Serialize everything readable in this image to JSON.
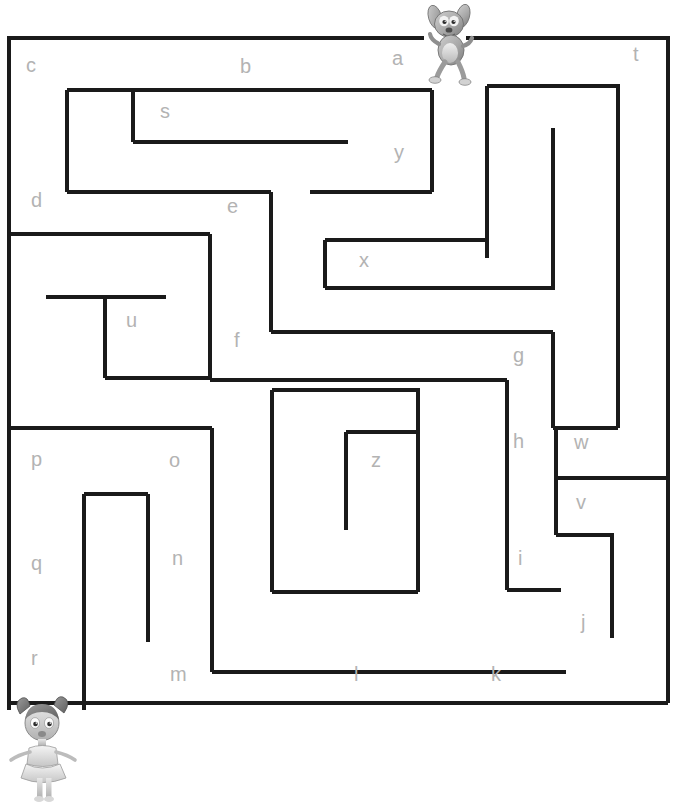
{
  "page": {
    "width": 678,
    "height": 808,
    "background": "#ffffff"
  },
  "maze": {
    "stroke_color": "#1a1a1a",
    "stroke_width": 4,
    "letter_color": "#b3b3b3",
    "letter_font_size": 20,
    "outer_border": {
      "x": 7,
      "y": 36,
      "width": 663,
      "height": 669
    },
    "entrance": {
      "name": "top-entrance",
      "x_start": 424,
      "x_end": 466,
      "y": 36
    },
    "exit": {
      "name": "bottom-left-exit",
      "x": 7,
      "y_start": 710,
      "y_end": 705
    },
    "letters": [
      {
        "id": "a",
        "label": "a",
        "x": 392,
        "y": 48
      },
      {
        "id": "b",
        "label": "b",
        "x": 240,
        "y": 56
      },
      {
        "id": "c",
        "label": "c",
        "x": 26,
        "y": 55
      },
      {
        "id": "d",
        "label": "d",
        "x": 31,
        "y": 190
      },
      {
        "id": "e",
        "label": "e",
        "x": 227,
        "y": 196
      },
      {
        "id": "f",
        "label": "f",
        "x": 234,
        "y": 330
      },
      {
        "id": "g",
        "label": "g",
        "x": 513,
        "y": 345
      },
      {
        "id": "h",
        "label": "h",
        "x": 513,
        "y": 431
      },
      {
        "id": "i",
        "label": "i",
        "x": 518,
        "y": 548
      },
      {
        "id": "j",
        "label": "j",
        "x": 581,
        "y": 612
      },
      {
        "id": "k",
        "label": "k",
        "x": 491,
        "y": 664
      },
      {
        "id": "l",
        "label": "l",
        "x": 354,
        "y": 664
      },
      {
        "id": "m",
        "label": "m",
        "x": 170,
        "y": 664
      },
      {
        "id": "n",
        "label": "n",
        "x": 172,
        "y": 548
      },
      {
        "id": "o",
        "label": "o",
        "x": 169,
        "y": 450
      },
      {
        "id": "p",
        "label": "p",
        "x": 31,
        "y": 449
      },
      {
        "id": "q",
        "label": "q",
        "x": 31,
        "y": 553
      },
      {
        "id": "r",
        "label": "r",
        "x": 31,
        "y": 648
      },
      {
        "id": "s",
        "label": "s",
        "x": 160,
        "y": 101
      },
      {
        "id": "t",
        "label": "t",
        "x": 633,
        "y": 44
      },
      {
        "id": "u",
        "label": "u",
        "x": 126,
        "y": 310
      },
      {
        "id": "v",
        "label": "v",
        "x": 576,
        "y": 492
      },
      {
        "id": "w",
        "label": "w",
        "x": 574,
        "y": 432
      },
      {
        "id": "x",
        "label": "x",
        "x": 359,
        "y": 250
      },
      {
        "id": "y",
        "label": "y",
        "x": 394,
        "y": 142
      },
      {
        "id": "z",
        "label": "z",
        "x": 371,
        "y": 450
      }
    ],
    "walls": [
      {
        "id": "border-top-left",
        "x1": 7,
        "y1": 38,
        "x2": 424,
        "y2": 38
      },
      {
        "id": "border-top-right",
        "x1": 466,
        "y1": 38,
        "x2": 670,
        "y2": 38
      },
      {
        "id": "border-right",
        "x1": 668,
        "y1": 38,
        "x2": 668,
        "y2": 703
      },
      {
        "id": "border-bottom",
        "x1": 7,
        "y1": 703,
        "x2": 668,
        "y2": 703
      },
      {
        "id": "border-left-upper",
        "x1": 9,
        "y1": 38,
        "x2": 9,
        "y2": 710
      },
      {
        "id": "w-s-top",
        "x1": 67,
        "y1": 90,
        "x2": 240,
        "y2": 90
      },
      {
        "id": "w-s-top2",
        "x1": 240,
        "y1": 90,
        "x2": 328,
        "y2": 90
      },
      {
        "id": "w-s-vert",
        "x1": 133,
        "y1": 90,
        "x2": 133,
        "y2": 142
      },
      {
        "id": "w-s-bottom",
        "x1": 133,
        "y1": 142,
        "x2": 348,
        "y2": 142
      },
      {
        "id": "w-c-vert",
        "x1": 67,
        "y1": 90,
        "x2": 67,
        "y2": 192
      },
      {
        "id": "w-d-bottom",
        "x1": 67,
        "y1": 192,
        "x2": 271,
        "y2": 192
      },
      {
        "id": "w-y-top",
        "x1": 310,
        "y1": 90,
        "x2": 432,
        "y2": 90
      },
      {
        "id": "w-y-right",
        "x1": 432,
        "y1": 90,
        "x2": 432,
        "y2": 192
      },
      {
        "id": "w-y-bottom",
        "x1": 310,
        "y1": 192,
        "x2": 432,
        "y2": 192
      },
      {
        "id": "w-right-inner-top",
        "x1": 487,
        "y1": 86,
        "x2": 620,
        "y2": 86
      },
      {
        "id": "w-right-inner-l",
        "x1": 487,
        "y1": 86,
        "x2": 487,
        "y2": 258
      },
      {
        "id": "w-right-inner-r",
        "x1": 618,
        "y1": 86,
        "x2": 618,
        "y2": 428
      },
      {
        "id": "w-e-vert",
        "x1": 271,
        "y1": 192,
        "x2": 271,
        "y2": 332
      },
      {
        "id": "w-u-top",
        "x1": 9,
        "y1": 234,
        "x2": 210,
        "y2": 234
      },
      {
        "id": "w-u-right",
        "x1": 210,
        "y1": 234,
        "x2": 210,
        "y2": 378
      },
      {
        "id": "w-u-bar",
        "x1": 46,
        "y1": 297,
        "x2": 166,
        "y2": 297
      },
      {
        "id": "w-u-stub",
        "x1": 105,
        "y1": 297,
        "x2": 105,
        "y2": 378
      },
      {
        "id": "w-u-bottom",
        "x1": 105,
        "y1": 378,
        "x2": 210,
        "y2": 378
      },
      {
        "id": "w-x-left",
        "x1": 325,
        "y1": 240,
        "x2": 325,
        "y2": 288
      },
      {
        "id": "w-x-top",
        "x1": 325,
        "y1": 240,
        "x2": 487,
        "y2": 240
      },
      {
        "id": "w-x-bottom",
        "x1": 325,
        "y1": 288,
        "x2": 555,
        "y2": 288
      },
      {
        "id": "w-x-right",
        "x1": 553,
        "y1": 128,
        "x2": 553,
        "y2": 288
      },
      {
        "id": "w-f-bottom",
        "x1": 271,
        "y1": 332,
        "x2": 553,
        "y2": 332
      },
      {
        "id": "w-g-vert",
        "x1": 553,
        "y1": 332,
        "x2": 553,
        "y2": 428
      },
      {
        "id": "w-g-horiz",
        "x1": 553,
        "y1": 428,
        "x2": 618,
        "y2": 428
      },
      {
        "id": "w-mid-horiz",
        "x1": 210,
        "y1": 380,
        "x2": 507,
        "y2": 380
      },
      {
        "id": "w-h-vert",
        "x1": 507,
        "y1": 380,
        "x2": 507,
        "y2": 590
      },
      {
        "id": "w-i-horiz",
        "x1": 507,
        "y1": 590,
        "x2": 561,
        "y2": 590
      },
      {
        "id": "w-wv-divider",
        "x1": 556,
        "y1": 478,
        "x2": 668,
        "y2": 478
      },
      {
        "id": "w-v-left",
        "x1": 556,
        "y1": 428,
        "x2": 556,
        "y2": 535
      },
      {
        "id": "w-v-bottom",
        "x1": 556,
        "y1": 535,
        "x2": 614,
        "y2": 535
      },
      {
        "id": "w-j-vert",
        "x1": 612,
        "y1": 535,
        "x2": 612,
        "y2": 638
      },
      {
        "id": "w-o-top",
        "x1": 9,
        "y1": 428,
        "x2": 212,
        "y2": 428
      },
      {
        "id": "w-o-right",
        "x1": 212,
        "y1": 428,
        "x2": 212,
        "y2": 672
      },
      {
        "id": "w-m-bottom",
        "x1": 212,
        "y1": 672,
        "x2": 566,
        "y2": 672
      },
      {
        "id": "w-n-left",
        "x1": 84,
        "y1": 494,
        "x2": 84,
        "y2": 710
      },
      {
        "id": "w-n-top",
        "x1": 84,
        "y1": 494,
        "x2": 148,
        "y2": 494
      },
      {
        "id": "w-n-right",
        "x1": 148,
        "y1": 494,
        "x2": 148,
        "y2": 642
      },
      {
        "id": "w-center-left",
        "x1": 272,
        "y1": 390,
        "x2": 272,
        "y2": 592
      },
      {
        "id": "w-center-top",
        "x1": 272,
        "y1": 390,
        "x2": 420,
        "y2": 390
      },
      {
        "id": "w-center-right",
        "x1": 418,
        "y1": 390,
        "x2": 418,
        "y2": 592
      },
      {
        "id": "w-center-bottom",
        "x1": 272,
        "y1": 592,
        "x2": 418,
        "y2": 592
      },
      {
        "id": "w-z-left",
        "x1": 346,
        "y1": 432,
        "x2": 346,
        "y2": 530
      },
      {
        "id": "w-z-top",
        "x1": 346,
        "y1": 432,
        "x2": 416,
        "y2": 432
      }
    ]
  },
  "sprites": [
    {
      "id": "dog-sprite",
      "name": "dog-character",
      "label": "dog",
      "position": "top-entrance"
    },
    {
      "id": "girl-sprite",
      "name": "girl-character",
      "label": "girl",
      "position": "bottom-left-exit"
    }
  ]
}
